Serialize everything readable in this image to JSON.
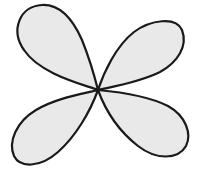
{
  "diagram": {
    "center": [
      98,
      90
    ],
    "colors": {
      "background": "#ffffff",
      "fill": "#e9e9e9",
      "stroke": "#1a1a1a"
    },
    "lobes": [
      {
        "name": "upper-left"
      },
      {
        "name": "upper-right"
      },
      {
        "name": "lower-left"
      },
      {
        "name": "lower-right"
      }
    ]
  }
}
